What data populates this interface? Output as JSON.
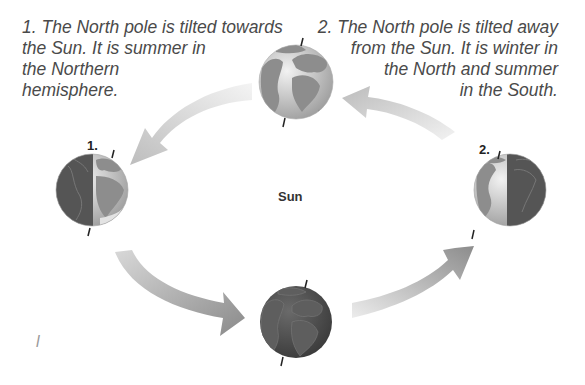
{
  "captions": {
    "position_1": {
      "lines": [
        "1. The North pole is tilted towards",
        "the Sun. It is summer in",
        "the Northern",
        "hemisphere."
      ]
    },
    "position_2": {
      "lines": [
        "2. The North pole is tilted away",
        "from the Sun. It is winter in",
        "the North and summer",
        "in the South."
      ]
    }
  },
  "labels": {
    "sun": "Sun",
    "marker_1": "1.",
    "marker_2": "2."
  },
  "globes": [
    {
      "id": "top",
      "lit": "full"
    },
    {
      "id": "left",
      "lit": "right-half",
      "marker": "1."
    },
    {
      "id": "right",
      "lit": "left-half",
      "marker": "2."
    },
    {
      "id": "bottom",
      "lit": "none"
    }
  ],
  "arrows": [
    {
      "from": "top",
      "to": "left",
      "direction": "counterclockwise"
    },
    {
      "from": "left",
      "to": "bottom"
    },
    {
      "from": "bottom",
      "to": "right"
    },
    {
      "from": "right",
      "to": "top"
    }
  ],
  "colors": {
    "text": "#4a4a4a",
    "arrow_light": "#e6e6e6",
    "arrow_dark": "#8a8a8a",
    "globe_ocean": "#c8c8c8",
    "globe_land": "#8f8f8f",
    "globe_dark": "#4c4c4c"
  },
  "scribble": "l"
}
